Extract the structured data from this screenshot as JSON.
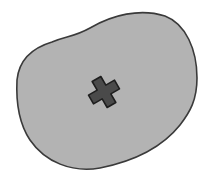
{
  "diagram": {
    "region": {
      "fill": "#b3b3b3",
      "stroke": "#3a3a3a",
      "path": "M 52 42 C 66 36, 74 37, 90 28 C 112 15, 140 8, 165 16 C 186 24, 197 50, 197 78 C 197 100, 190 112, 180 125 C 160 150, 130 162, 100 168 C 72 173, 45 162, 30 140 C 18 122, 16 100, 17 80 C 19 60, 32 48, 52 42 Z"
    },
    "marker": {
      "type": "cross-icon",
      "fill": "#4a4a4a",
      "stroke": "#1e1e1e",
      "center_x": 104,
      "center_y": 92,
      "rotation_deg": -30
    }
  }
}
